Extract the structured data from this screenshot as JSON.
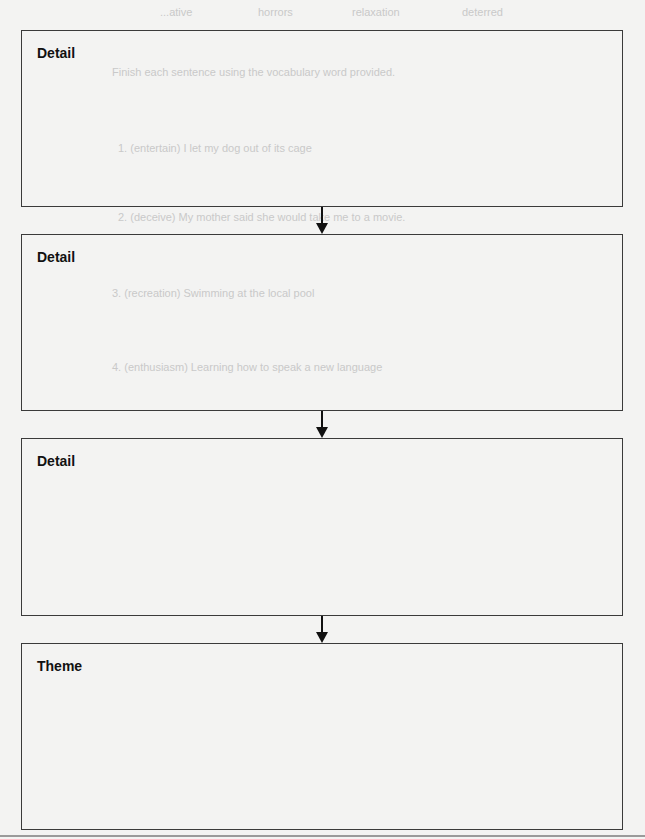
{
  "organizer": {
    "boxes": [
      {
        "label": "Detail"
      },
      {
        "label": "Detail"
      },
      {
        "label": "Detail"
      },
      {
        "label": "Theme"
      }
    ]
  },
  "bleed_through": {
    "word_bank": [
      "...ative",
      "horrors",
      "relaxation",
      "deterred"
    ],
    "instruction": "Finish each sentence using the vocabulary word provided.",
    "items": [
      "1. (entertain) I let my dog out of its cage",
      "2. (deceive) My mother said she would take me to a movie.",
      "3. (recreation) Swimming at the local pool",
      "4. (enthusiasm) Learning how to speak a new language"
    ]
  }
}
